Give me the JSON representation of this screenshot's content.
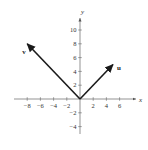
{
  "diagram": {
    "type": "vector-plot",
    "axes": {
      "x_label": "x",
      "y_label": "y",
      "x_ticks": [
        -8,
        -6,
        -4,
        -2,
        2,
        4,
        6
      ],
      "y_ticks": [
        10,
        8,
        6,
        4,
        2,
        -2,
        -4
      ],
      "x_tick_labels": [
        "−8",
        "−6",
        "−4",
        "−2",
        "2",
        "4",
        "6"
      ],
      "y_tick_labels": [
        "10",
        "8",
        "6",
        "4",
        "2",
        "−2",
        "−4"
      ]
    },
    "vectors": [
      {
        "name": "v",
        "label": "v",
        "from": [
          0,
          0
        ],
        "to": [
          -8,
          8
        ]
      },
      {
        "name": "u",
        "label": "u",
        "from": [
          0,
          0
        ],
        "to": [
          5,
          5
        ]
      }
    ],
    "colors": {
      "axis": "#555555",
      "vector": "#1a1a1a",
      "text": "#333333"
    }
  }
}
